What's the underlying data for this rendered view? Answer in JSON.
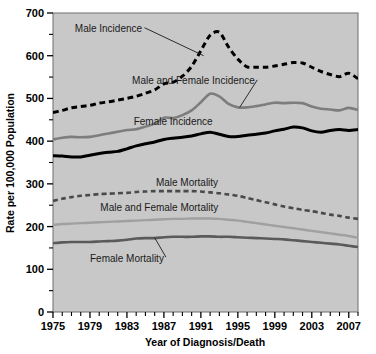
{
  "chart_data": {
    "type": "line",
    "title": "",
    "xlabel": "Year of Diagnosis/Death",
    "ylabel": "Rate per 100,000 Population",
    "xlim": [
      1975,
      2008
    ],
    "ylim": [
      0,
      700
    ],
    "grid": false,
    "legend_position": "inline-annotations",
    "background_color": "#c8c8c8",
    "x_major_ticks": [
      1975,
      1979,
      1983,
      1987,
      1991,
      1995,
      1999,
      2003,
      2007
    ],
    "x_minor_tick_step": 1,
    "y_major_ticks": [
      0,
      100,
      200,
      300,
      400,
      500,
      600,
      700
    ],
    "y_minor_ticks": [
      50,
      150,
      250,
      350,
      450,
      550,
      650
    ],
    "x": [
      1975,
      1976,
      1977,
      1978,
      1979,
      1980,
      1981,
      1982,
      1983,
      1984,
      1985,
      1986,
      1987,
      1988,
      1989,
      1990,
      1991,
      1992,
      1993,
      1994,
      1995,
      1996,
      1997,
      1998,
      1999,
      2000,
      2001,
      2002,
      2003,
      2004,
      2005,
      2006,
      2007,
      2008
    ],
    "series": [
      {
        "name": "Male Incidence",
        "style": "dashed",
        "color": "#000000",
        "width": 3,
        "values": [
          467,
          472,
          478,
          481,
          484,
          489,
          492,
          496,
          500,
          505,
          512,
          520,
          534,
          538,
          552,
          575,
          612,
          648,
          655,
          620,
          592,
          574,
          573,
          573,
          576,
          580,
          584,
          583,
          573,
          563,
          556,
          551,
          559,
          546
        ],
        "label": {
          "text": "Male Incidence",
          "x": 1981.0,
          "y": 655,
          "leader": true
        }
      },
      {
        "name": "Male and Female Incidence",
        "style": "solid",
        "color": "#7d7d7d",
        "width": 2.6,
        "values": [
          404,
          408,
          410,
          409,
          410,
          414,
          418,
          422,
          426,
          428,
          434,
          441,
          455,
          454,
          461,
          472,
          491,
          511,
          505,
          487,
          479,
          479,
          482,
          486,
          490,
          489,
          490,
          489,
          481,
          476,
          474,
          472,
          478,
          473
        ],
        "label": {
          "text": "Male and Female Incidence",
          "x": 1990.2,
          "y": 533,
          "leader": true
        }
      },
      {
        "name": "Female Incidence",
        "style": "solid",
        "color": "#000000",
        "width": 3,
        "values": [
          366,
          365,
          363,
          363,
          367,
          371,
          374,
          376,
          382,
          389,
          394,
          398,
          404,
          407,
          409,
          412,
          417,
          421,
          416,
          411,
          411,
          414,
          416,
          419,
          424,
          428,
          433,
          431,
          424,
          421,
          425,
          427,
          425,
          427
        ],
        "label": {
          "text": "Female Incidence",
          "x": 1988.0,
          "y": 437,
          "leader": false
        }
      },
      {
        "name": "Male Mortality",
        "style": "dashed",
        "color": "#4a4a4a",
        "width": 2.6,
        "values": [
          260,
          265,
          269,
          272,
          274,
          276,
          277,
          278,
          279,
          281,
          282,
          283,
          283,
          283,
          283,
          283,
          282,
          280,
          278,
          275,
          272,
          267,
          262,
          257,
          252,
          247,
          243,
          239,
          236,
          232,
          228,
          225,
          221,
          218
        ],
        "label": {
          "text": "Male Mortality",
          "x": 1989.5,
          "y": 296,
          "leader": false
        }
      },
      {
        "name": "Male and Female Mortality",
        "style": "solid",
        "color": "#a0a0a0",
        "width": 2.4,
        "values": [
          204,
          206,
          207,
          208,
          209,
          210,
          211,
          212,
          213,
          214,
          215,
          216,
          217,
          218,
          218,
          219,
          219,
          219,
          218,
          216,
          214,
          211,
          208,
          205,
          202,
          199,
          196,
          193,
          190,
          187,
          184,
          181,
          178,
          174
        ],
        "label": {
          "text": "Male and Female Mortality",
          "x": 1986.5,
          "y": 237,
          "leader": false
        }
      },
      {
        "name": "Female Mortality",
        "style": "solid",
        "color": "#5a5a5a",
        "width": 2.6,
        "values": [
          161,
          163,
          164,
          164,
          164,
          165,
          166,
          167,
          169,
          172,
          173,
          173,
          175,
          176,
          176,
          176,
          177,
          177,
          176,
          176,
          175,
          174,
          173,
          172,
          171,
          170,
          168,
          166,
          164,
          162,
          160,
          158,
          155,
          152
        ],
        "label": {
          "text": "Female Mortality",
          "x": 1983.0,
          "y": 118,
          "leader": true
        }
      }
    ]
  },
  "axes": {
    "y_labels": [
      "700",
      "600",
      "500",
      "400",
      "300",
      "200",
      "100",
      "0"
    ],
    "x_labels": [
      "1975",
      "1979",
      "1983",
      "1987",
      "1991",
      "1995",
      "1999",
      "2003",
      "2007"
    ],
    "y_title": "Rate per 100,000 Population",
    "x_title": "Year of Diagnosis/Death"
  }
}
